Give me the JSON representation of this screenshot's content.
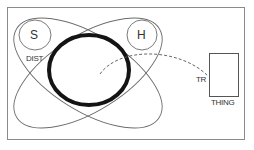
{
  "diagram": {
    "title": "",
    "colors": {
      "stroke": "#6b6b6b",
      "thick": "#141414",
      "frame": "#8a8a8a",
      "text": "#333333"
    },
    "labels": {
      "s": "S",
      "h": "H",
      "dist": "DIST",
      "tr": "TR",
      "thing": "THING"
    },
    "nodes": [
      {
        "id": "S",
        "shape": "circle",
        "label": "S"
      },
      {
        "id": "H",
        "shape": "circle",
        "label": "H"
      },
      {
        "id": "center-ring",
        "shape": "thick-ellipse",
        "label": ""
      },
      {
        "id": "thing-box",
        "shape": "rectangle",
        "label": "THING"
      }
    ],
    "edges": [
      {
        "from": "center-ring",
        "to": "thing-box",
        "style": "dashed",
        "label": "TR"
      }
    ],
    "region_labels": [
      "DIST"
    ]
  }
}
